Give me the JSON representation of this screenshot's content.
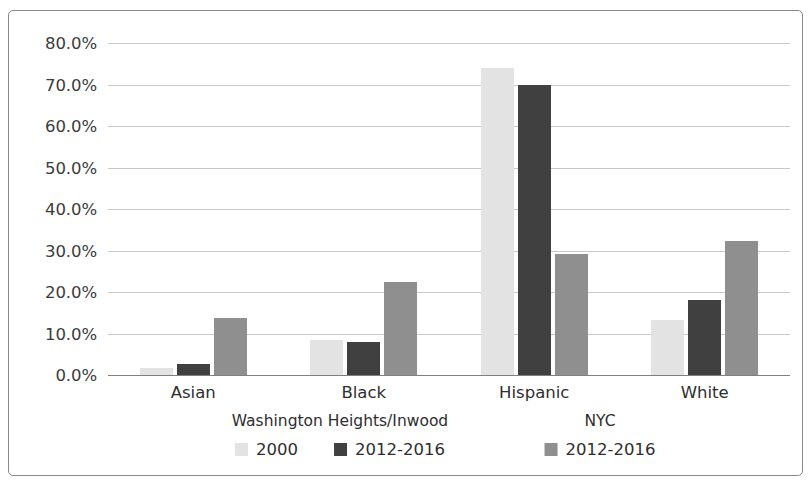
{
  "chart_data": {
    "type": "bar",
    "title": "",
    "subtitle": "",
    "xlabel": "",
    "ylabel": "",
    "categories": [
      "Asian",
      "Black",
      "Hispanic",
      "White"
    ],
    "ylim": [
      0,
      80
    ],
    "y_ticks": [
      0,
      10,
      20,
      30,
      40,
      50,
      60,
      70,
      80
    ],
    "y_tick_labels": [
      "0.0%",
      "10.0%",
      "20.0%",
      "30.0%",
      "40.0%",
      "50.0%",
      "60.0%",
      "70.0%",
      "80.0%"
    ],
    "grid": true,
    "legend_position": "bottom",
    "value_suffix": "%",
    "series": [
      {
        "name": "2000",
        "group": "Washington Heights/Inwood",
        "color": "#e3e3e3",
        "values": [
          1.7,
          8.5,
          73.9,
          13.3
        ]
      },
      {
        "name": "2012-2016",
        "group": "Washington Heights/Inwood",
        "color": "#404040",
        "values": [
          2.6,
          8.0,
          70.0,
          18.0
        ]
      },
      {
        "name": "2012-2016",
        "group": "NYC",
        "color": "#8f8f8f",
        "values": [
          13.7,
          22.3,
          29.1,
          32.2
        ]
      }
    ]
  },
  "legend": {
    "groups": [
      {
        "title": "Washington Heights/Inwood",
        "center_x": 340,
        "items": [
          {
            "label": "2000",
            "color": "#e3e3e3"
          },
          {
            "label": "2012-2016",
            "color": "#404040"
          }
        ]
      },
      {
        "title": "NYC",
        "center_x": 600,
        "items": [
          {
            "label": "2012-2016",
            "color": "#8f8f8f"
          }
        ]
      }
    ]
  },
  "style": {
    "grid_color": "#c8c8c8",
    "axis_color": "#808080",
    "border_color": "#8a8a8a",
    "text_color": "#2e2e2e",
    "background": "#ffffff"
  }
}
